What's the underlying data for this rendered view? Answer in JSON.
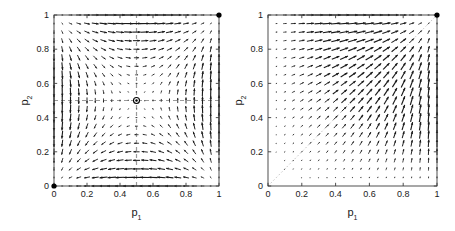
{
  "figure": {
    "background": "#ffffff",
    "width": 455,
    "height": 231,
    "axis_color": "#3c3c3c",
    "arrow_color": "#1a1a1a",
    "dash_color": "#9a9a9a",
    "separatrix_color": "#c8c8c8",
    "marker_color": "#000000"
  },
  "chart_data": [
    {
      "id": "left-panel",
      "type": "quiver",
      "title": "",
      "xlabel": "p",
      "xlabel_sub": "1",
      "ylabel": "p",
      "ylabel_sub": "2",
      "xlim": [
        0,
        1
      ],
      "ylim": [
        0,
        1
      ],
      "xticks": [
        0,
        0.2,
        0.4,
        0.6,
        0.8,
        1
      ],
      "yticks": [
        0,
        0.2,
        0.4,
        0.6,
        0.8,
        1
      ],
      "xticklabels": [
        "0",
        "0.2",
        "0.4",
        "0.6",
        "0.8",
        "1"
      ],
      "yticklabels": [
        "0",
        "0.2",
        "0.4",
        "0.6",
        "0.8",
        "1"
      ],
      "grid": false,
      "legend": "none",
      "field_model": "saddle",
      "field_formula": "dp1 = p1*(1-p1)*(2*p2-1); dp2 = p2*(1-p2)*(2*p1-1)",
      "grid_n": 21,
      "arrow_scale": 0.92,
      "annotations": [
        {
          "kind": "dashed-vline",
          "x": 0.5
        },
        {
          "kind": "dashed-hline",
          "y": 0.5
        },
        {
          "kind": "filled-dot",
          "x": 0.0,
          "y": 0.0
        },
        {
          "kind": "filled-dot",
          "x": 1.0,
          "y": 1.0
        },
        {
          "kind": "open-dot",
          "x": 0.5,
          "y": 0.5
        }
      ]
    },
    {
      "id": "right-panel",
      "type": "quiver",
      "title": "",
      "xlabel": "p",
      "xlabel_sub": "1",
      "ylabel": "p",
      "ylabel_sub": "2",
      "xlim": [
        0,
        1
      ],
      "ylim": [
        0,
        1
      ],
      "xticks": [
        0,
        0.2,
        0.4,
        0.6,
        0.8,
        1
      ],
      "yticks": [
        0,
        0.2,
        0.4,
        0.6,
        0.8,
        1
      ],
      "xticklabels": [
        "0",
        "0.2",
        "0.4",
        "0.6",
        "0.8",
        "1"
      ],
      "yticklabels": [
        "0",
        "0.2",
        "0.4",
        "0.6",
        "0.8",
        "1"
      ],
      "grid": false,
      "legend": "none",
      "field_model": "coordination",
      "field_formula": "dp1 = p1*(1-p1)*p2; dp2 = p2*(1-p2)*p1",
      "grid_n": 21,
      "arrow_scale": 0.92,
      "annotations": [
        {
          "kind": "separatrix-diagonal",
          "from": [
            0,
            0
          ],
          "to": [
            1,
            1
          ]
        },
        {
          "kind": "filled-dot",
          "x": 1.0,
          "y": 1.0
        }
      ]
    }
  ]
}
